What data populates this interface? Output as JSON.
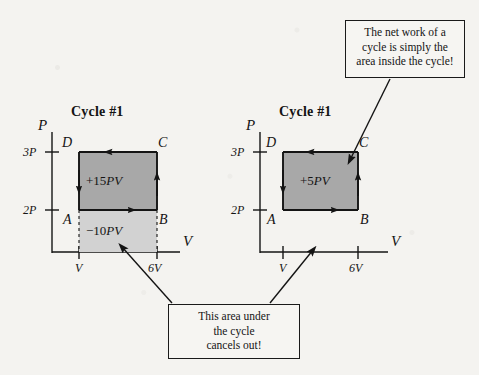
{
  "figure": {
    "background_color": "#f4f3f0",
    "ink_color": "#141414",
    "fill_dark": "#a8a8a8",
    "fill_light": "#d2d2d2"
  },
  "chart_data": {
    "type": "line",
    "panels": [
      {
        "id": "left",
        "title": "Cycle #1",
        "xlabel": "V",
        "ylabel": "P",
        "xticks": [
          "V",
          "6V"
        ],
        "yticks": [
          "2P",
          "3P"
        ],
        "grid": false,
        "points": [
          {
            "label": "A",
            "x": "V",
            "y": "2P"
          },
          {
            "label": "B",
            "x": "6V",
            "y": "2P"
          },
          {
            "label": "C",
            "x": "6V",
            "y": "3P"
          },
          {
            "label": "D",
            "x": "V",
            "y": "3P"
          }
        ],
        "path_direction": [
          "A->B",
          "B->C",
          "C->D",
          "D->A"
        ],
        "regions": [
          {
            "name": "cycle-area",
            "value": "+15PV",
            "shade": "dark"
          },
          {
            "name": "area-under-cycle",
            "value": "−10PV",
            "shade": "light"
          }
        ]
      },
      {
        "id": "right",
        "title": "Cycle #1",
        "xlabel": "V",
        "ylabel": "P",
        "xticks": [
          "V",
          "6V"
        ],
        "yticks": [
          "2P",
          "3P"
        ],
        "grid": false,
        "points": [
          {
            "label": "A",
            "x": "V",
            "y": "2P"
          },
          {
            "label": "B",
            "x": "6V",
            "y": "2P"
          },
          {
            "label": "C",
            "x": "6V",
            "y": "3P"
          },
          {
            "label": "D",
            "x": "V",
            "y": "3P"
          }
        ],
        "path_direction": [
          "A->B",
          "B->C",
          "C->D",
          "D->A"
        ],
        "regions": [
          {
            "name": "cycle-area",
            "value": "+5PV",
            "shade": "dark"
          }
        ]
      }
    ]
  },
  "left_panel": {
    "title": "Cycle #1",
    "axis_p": "P",
    "axis_v": "V",
    "tick_3p": "3P",
    "tick_2p": "2P",
    "tick_v": "V",
    "tick_6v": "6V",
    "corner_a": "A",
    "corner_b": "B",
    "corner_c": "C",
    "corner_d": "D",
    "area_inside": "+15PV",
    "area_under": "−10PV"
  },
  "right_panel": {
    "title": "Cycle #1",
    "axis_p": "P",
    "axis_v": "V",
    "tick_3p": "3P",
    "tick_2p": "2P",
    "tick_v": "V",
    "tick_6v": "6V",
    "corner_a": "A",
    "corner_b": "B",
    "corner_c": "C",
    "corner_d": "D",
    "area_inside": "+5PV"
  },
  "callouts": {
    "top_right": {
      "line1": "The net work of a",
      "line2": "cycle is simply the",
      "line3": "area inside the cycle!"
    },
    "bottom": {
      "line1": "This area under",
      "line2": "the cycle",
      "line3": "cancels out!"
    }
  }
}
